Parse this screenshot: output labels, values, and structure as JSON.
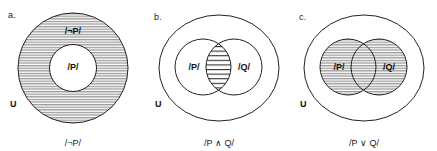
{
  "figure": {
    "background": "#ffffff",
    "stroke_color": "#222222",
    "hatch_color": "#8c8c8c"
  },
  "panels": [
    {
      "letter": "a.",
      "universe_label": "U",
      "caption": "/¬P/",
      "labels": {
        "outer_region": "/¬P/",
        "inner_region": "/P/"
      }
    },
    {
      "letter": "b.",
      "universe_label": "U",
      "caption": "/P ∧ Q/",
      "labels": {
        "left_circle": "/P/",
        "right_circle": "/Q/"
      }
    },
    {
      "letter": "c.",
      "universe_label": "U",
      "caption": "/P ∨ Q/",
      "labels": {
        "left_circle": "/P/",
        "right_circle": "/Q/"
      }
    }
  ]
}
